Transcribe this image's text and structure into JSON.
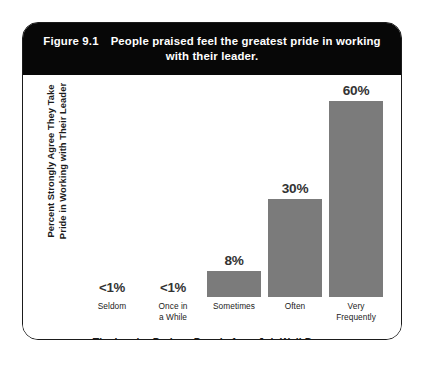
{
  "figure": {
    "label": "Figure 9.1",
    "title_line1": "People praised feel the greatest pride in working",
    "title_line2": "with their leader.",
    "band_color": "#070707",
    "bar_color": "#7b7b7b",
    "border_color": "#1b1b1b",
    "text_color": "#1b1b1b"
  },
  "chart_data": {
    "type": "bar",
    "xlabel": "The Leader Praises People for a Job Well Done",
    "ylabel": "Percent Strongly Agree They Take Pride in Working with Their Leader",
    "ylabel_line1": "Percent Strongly Agree They Take",
    "ylabel_line2": "Pride in Working with Their Leader",
    "categories": [
      "Seldom",
      "Once in a While",
      "Sometimes",
      "Often",
      "Very Frequently"
    ],
    "category_lines": [
      [
        "Seldom"
      ],
      [
        "Once in",
        "a While"
      ],
      [
        "Sometimes"
      ],
      [
        "Often"
      ],
      [
        "Very",
        "Frequently"
      ]
    ],
    "values": [
      0.5,
      0.5,
      8,
      30,
      60
    ],
    "value_labels": [
      "<1%",
      "<1%",
      "8%",
      "30%",
      "60%"
    ],
    "bar_visible": [
      false,
      false,
      true,
      true,
      true
    ],
    "ylim": [
      0,
      66
    ],
    "grid": false,
    "legend": "none"
  }
}
